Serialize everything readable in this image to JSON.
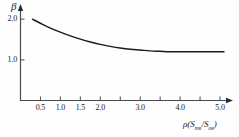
{
  "chart_data": {
    "type": "line",
    "title": "",
    "xlabel": "ρ(Sтк/Sок)",
    "ylabel": "β",
    "xlim": [
      0.0,
      5.2
    ],
    "ylim": [
      0.0,
      2.25
    ],
    "grid": false,
    "legend": null,
    "x_ticks": [
      {
        "value": 0.5,
        "label": "0.5"
      },
      {
        "value": 1.0,
        "label": "1.0"
      },
      {
        "value": 1.5,
        "label": "1.5"
      },
      {
        "value": 2.0,
        "label": "2.0"
      },
      {
        "value": 2.5,
        "label": ""
      },
      {
        "value": 3.0,
        "label": "3.0"
      },
      {
        "value": 3.5,
        "label": ""
      },
      {
        "value": 4.0,
        "label": "4.0"
      },
      {
        "value": 4.5,
        "label": ""
      },
      {
        "value": 5.0,
        "label": "5.0"
      }
    ],
    "y_ticks": [
      {
        "value": 1.0,
        "label": "1.0"
      },
      {
        "value": 2.0,
        "label": "2.0"
      }
    ],
    "series": [
      {
        "name": "beta-curve",
        "color": "#1a1a1a",
        "x": [
          0.3,
          0.5,
          0.75,
          1.0,
          1.25,
          1.5,
          1.75,
          2.0,
          2.25,
          2.5,
          2.75,
          3.0,
          3.25,
          3.5,
          3.75,
          4.0,
          4.25,
          4.5,
          4.75,
          5.0,
          5.1
        ],
        "y": [
          2.0,
          1.9,
          1.78,
          1.68,
          1.59,
          1.51,
          1.44,
          1.38,
          1.33,
          1.29,
          1.26,
          1.24,
          1.22,
          1.21,
          1.2,
          1.2,
          1.2,
          1.2,
          1.2,
          1.2,
          1.2
        ]
      }
    ],
    "axis_arrows": {
      "x": true,
      "y": true
    }
  },
  "xlabel_parts": {
    "rho": "ρ",
    "open": "(",
    "s1": "S",
    "sub1": "тк",
    "slash": "/",
    "s2": "S",
    "sub2": "ок",
    "close": ")"
  }
}
